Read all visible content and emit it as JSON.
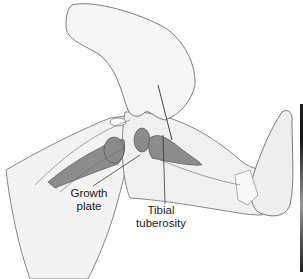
{
  "figure": {
    "labels": {
      "growth_plate": [
        "Growth",
        "plate"
      ],
      "tibial_tuberosity": [
        "Tibial",
        "tuberosity"
      ]
    },
    "colors": {
      "skin": "#f2f2f2",
      "outline": "#555555",
      "bone_marrow": "#8a8a8a",
      "bone_cortex": "#e6e6e6",
      "leader_line": "#222222"
    }
  }
}
